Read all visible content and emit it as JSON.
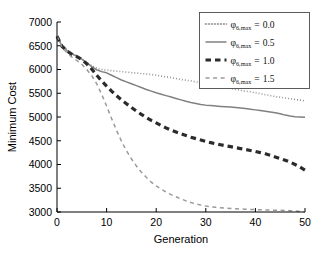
{
  "chart_data": {
    "type": "line",
    "title": "",
    "xlabel": "Generation",
    "ylabel": "Minimum Cost",
    "xlim": [
      0,
      50
    ],
    "ylim": [
      3000,
      7000
    ],
    "xticks": [
      0,
      10,
      20,
      30,
      40,
      50
    ],
    "xtick_labels": [
      "0",
      "10",
      "20",
      "30",
      "40",
      "50"
    ],
    "yticks": [
      3000,
      3500,
      4000,
      4500,
      5000,
      5500,
      6000,
      6500,
      7000
    ],
    "ytick_labels": [
      "3000",
      "3500",
      "4000",
      "4500",
      "5000",
      "5500",
      "6000",
      "6500",
      "7000"
    ],
    "grid": false,
    "legend_position": "top-right",
    "legend_entries": [
      {
        "symbol": "φ",
        "subscript": "6,max",
        "equals": "=",
        "value": "0.0",
        "style": "dotted",
        "color": "#8a8a8a"
      },
      {
        "symbol": "φ",
        "subscript": "6,max",
        "equals": "=",
        "value": "0.5",
        "style": "solid",
        "color": "#808080"
      },
      {
        "symbol": "φ",
        "subscript": "6,max",
        "equals": "=",
        "value": "1.0",
        "style": "dashed-thick",
        "color": "#2b2b2b"
      },
      {
        "symbol": "φ",
        "subscript": "6,max",
        "equals": "=",
        "value": "1.5",
        "style": "dashed-thin",
        "color": "#9a9a9a"
      }
    ],
    "x": [
      0,
      1,
      2,
      3,
      4,
      5,
      6,
      7,
      8,
      9,
      10,
      11,
      12,
      13,
      14,
      15,
      16,
      17,
      18,
      19,
      20,
      21,
      22,
      23,
      24,
      25,
      26,
      27,
      28,
      29,
      30,
      31,
      32,
      33,
      34,
      35,
      36,
      37,
      38,
      39,
      40,
      41,
      42,
      43,
      44,
      45,
      46,
      47,
      48,
      49,
      50
    ],
    "series": [
      {
        "name": "phi_6max = 0.0",
        "style": "dotted",
        "color": "#8a8a8a",
        "width": 1.6,
        "values": [
          6700,
          6520,
          6420,
          6340,
          6290,
          6230,
          6150,
          6080,
          6030,
          6000,
          5985,
          5975,
          5965,
          5955,
          5945,
          5935,
          5925,
          5915,
          5905,
          5895,
          5880,
          5860,
          5845,
          5830,
          5810,
          5790,
          5775,
          5760,
          5740,
          5720,
          5700,
          5680,
          5660,
          5640,
          5620,
          5600,
          5580,
          5560,
          5545,
          5530,
          5510,
          5490,
          5470,
          5450,
          5430,
          5415,
          5400,
          5385,
          5370,
          5355,
          5340
        ]
      },
      {
        "name": "phi_6max = 0.5",
        "style": "solid",
        "color": "#808080",
        "width": 1.5,
        "values": [
          6700,
          6500,
          6400,
          6330,
          6280,
          6220,
          6140,
          6060,
          5995,
          5955,
          5930,
          5880,
          5830,
          5780,
          5740,
          5700,
          5660,
          5620,
          5580,
          5545,
          5510,
          5480,
          5450,
          5420,
          5390,
          5360,
          5330,
          5305,
          5285,
          5265,
          5250,
          5240,
          5230,
          5222,
          5215,
          5208,
          5200,
          5190,
          5180,
          5165,
          5150,
          5135,
          5120,
          5105,
          5090,
          5070,
          5040,
          5020,
          5005,
          5000,
          4995
        ]
      },
      {
        "name": "phi_6max = 1.0",
        "style": "dashed-thick",
        "color": "#2b2b2b",
        "width": 3.2,
        "values": [
          6700,
          6490,
          6390,
          6320,
          6270,
          6210,
          6120,
          6010,
          5880,
          5760,
          5650,
          5545,
          5450,
          5360,
          5280,
          5200,
          5125,
          5055,
          4990,
          4930,
          4875,
          4820,
          4770,
          4725,
          4685,
          4645,
          4610,
          4575,
          4545,
          4515,
          4485,
          4460,
          4435,
          4415,
          4395,
          4375,
          4355,
          4335,
          4315,
          4295,
          4275,
          4250,
          4225,
          4195,
          4160,
          4125,
          4090,
          4050,
          4000,
          3945,
          3880
        ]
      },
      {
        "name": "phi_6max = 1.5",
        "style": "dashed-thin",
        "color": "#9a9a9a",
        "width": 1.5,
        "values": [
          6700,
          6470,
          6350,
          6260,
          6190,
          6110,
          6000,
          5870,
          5700,
          5480,
          5230,
          4970,
          4720,
          4490,
          4290,
          4120,
          3970,
          3840,
          3730,
          3630,
          3550,
          3480,
          3420,
          3365,
          3320,
          3275,
          3235,
          3200,
          3170,
          3145,
          3125,
          3110,
          3098,
          3088,
          3080,
          3073,
          3068,
          3063,
          3058,
          3054,
          3050,
          3046,
          3043,
          3040,
          3038,
          3035,
          3032,
          3028,
          3022,
          3012,
          3000
        ]
      }
    ]
  }
}
